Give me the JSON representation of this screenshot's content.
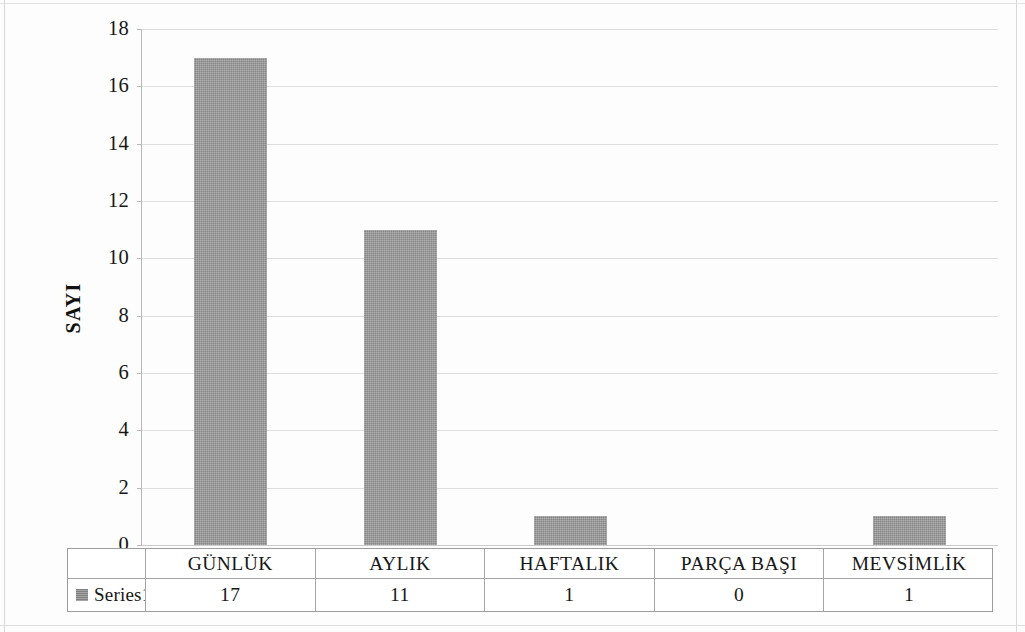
{
  "chart_data": {
    "type": "bar",
    "title": "",
    "subtitle": "",
    "xlabel": "",
    "ylabel": "SAYI",
    "categories": [
      "GÜNLÜK",
      "AYLIK",
      "HAFTALIK",
      "PARÇA BAŞI",
      "MEVSİMLİK"
    ],
    "series": [
      {
        "name": "Series1",
        "values": [
          17,
          11,
          1,
          0,
          1
        ],
        "color": "#9a9a9a"
      }
    ],
    "values": [
      17,
      11,
      1,
      0,
      1
    ],
    "ylim": [
      0,
      18
    ],
    "y_tick_step": 2,
    "y_ticks": [
      "18",
      "16",
      "14",
      "12",
      "10",
      "8",
      "6",
      "4",
      "2",
      "0"
    ],
    "grid": "horizontal",
    "legend_position": "data-table-row",
    "has_data_table": true,
    "annotations": []
  },
  "axis": {
    "y_title": "SAYI",
    "ticks": [
      {
        "label": "18",
        "value": 18
      },
      {
        "label": "16",
        "value": 16
      },
      {
        "label": "14",
        "value": 14
      },
      {
        "label": "12",
        "value": 12
      },
      {
        "label": "10",
        "value": 10
      },
      {
        "label": "8",
        "value": 8
      },
      {
        "label": "6",
        "value": 6
      },
      {
        "label": "4",
        "value": 4
      },
      {
        "label": "2",
        "value": 2
      },
      {
        "label": "0",
        "value": 0
      }
    ]
  },
  "data_table": {
    "legend_label": "Series1",
    "legend_swatch_color": "#8e8e8e",
    "category_row": [
      "GÜNLÜK",
      "AYLIK",
      "HAFTALIK",
      "PARÇA BAŞI",
      "MEVSİMLİK"
    ],
    "value_row": [
      "17",
      "11",
      "1",
      "0",
      "1"
    ]
  },
  "colors": {
    "bar": "#9a9a9a",
    "gridline": "#dededd",
    "axis_line": "#b9b9b9",
    "table_border": "#9d9d9d",
    "text": "#171717",
    "background": "#fdfdfd"
  }
}
